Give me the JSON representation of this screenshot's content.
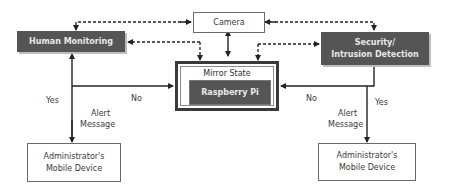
{
  "diagram": {
    "nodes": {
      "camera": {
        "label": "Camera"
      },
      "human_monitoring": {
        "label": "Human Monitoring"
      },
      "security": {
        "line1": "Security/",
        "line2": "Intrusion Detection"
      },
      "mirror_state": {
        "label": "Mirror State"
      },
      "raspberry_pi": {
        "label": "Raspberry Pi"
      },
      "admin_left": {
        "line1": "Administrator's",
        "line2": "Mobile Device"
      },
      "admin_right": {
        "line1": "Administrator's",
        "line2": "Mobile Device"
      }
    },
    "edge_labels": {
      "left_yes": "Yes",
      "left_no": "No",
      "left_alert_1": "Alert",
      "left_alert_2": "Message",
      "right_yes": "Yes",
      "right_no": "No",
      "right_alert_1": "Alert",
      "right_alert_2": "Message"
    },
    "colors": {
      "dark_box": "#555555",
      "dark_text": "#e8e8e8",
      "line": "#222222",
      "light_border": "#6a6a6a"
    }
  }
}
